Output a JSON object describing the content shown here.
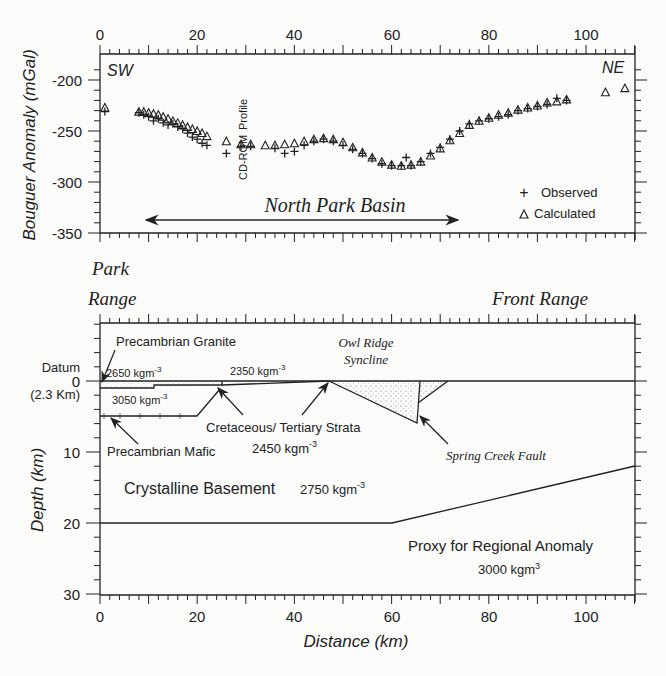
{
  "chart_data": [
    {
      "type": "scatter",
      "title": "",
      "xlabel": "Distance (km)",
      "ylabel": "Bouguer Anomaly (mGal)",
      "xlim": [
        0,
        110
      ],
      "ylim": [
        -350,
        -180
      ],
      "x_ticks": [
        0,
        20,
        40,
        60,
        80,
        100
      ],
      "y_ticks": [
        -200,
        -250,
        -300,
        -350
      ],
      "grid": false,
      "legend_position": "lower right",
      "legend": [
        "Observed",
        "Calculated"
      ],
      "annotations": [
        "SW",
        "NE",
        "CD-ROM Profile",
        "North Park Basin"
      ],
      "series": [
        {
          "name": "Observed",
          "marker": "+",
          "x": [
            1,
            8,
            9,
            10,
            11,
            12,
            13,
            14,
            15,
            16,
            17,
            18,
            19,
            20,
            21,
            22,
            26,
            29,
            31,
            36,
            38,
            40,
            42,
            44,
            46,
            48,
            50,
            52,
            54,
            56,
            58,
            60,
            62,
            63,
            64,
            66,
            68,
            70,
            72,
            74,
            76,
            78,
            80,
            82,
            84,
            86,
            88,
            90,
            92,
            94,
            96
          ],
          "y": [
            -231,
            -232,
            -234,
            -236,
            -240,
            -238,
            -242,
            -244,
            -243,
            -246,
            -248,
            -252,
            -256,
            -258,
            -262,
            -264,
            -272,
            -265,
            -265,
            -267,
            -272,
            -270,
            -264,
            -260,
            -258,
            -260,
            -264,
            -268,
            -272,
            -277,
            -282,
            -284,
            -284,
            -276,
            -284,
            -280,
            -272,
            -266,
            -258,
            -250,
            -243,
            -240,
            -238,
            -236,
            -234,
            -230,
            -228,
            -226,
            -224,
            -218,
            -220
          ]
        },
        {
          "name": "Calculated",
          "marker": "triangle",
          "x": [
            1,
            8,
            9,
            10,
            11,
            12,
            13,
            14,
            15,
            16,
            17,
            18,
            19,
            20,
            21,
            22,
            26,
            29,
            31,
            34,
            36,
            38,
            40,
            42,
            44,
            46,
            48,
            50,
            52,
            54,
            56,
            58,
            60,
            62,
            64,
            66,
            68,
            70,
            72,
            74,
            76,
            78,
            80,
            82,
            84,
            86,
            88,
            90,
            92,
            94,
            96,
            104,
            108
          ],
          "y": [
            -227,
            -231,
            -231,
            -232,
            -233,
            -234,
            -236,
            -238,
            -240,
            -242,
            -244,
            -246,
            -248,
            -250,
            -252,
            -255,
            -260,
            -263,
            -263,
            -264,
            -264,
            -263,
            -262,
            -260,
            -258,
            -257,
            -258,
            -261,
            -266,
            -271,
            -276,
            -280,
            -283,
            -284,
            -283,
            -280,
            -274,
            -267,
            -259,
            -252,
            -244,
            -240,
            -237,
            -234,
            -232,
            -229,
            -227,
            -225,
            -222,
            -221,
            -219,
            -212,
            -208
          ]
        }
      ]
    },
    {
      "type": "line",
      "title": "Cross-section density model",
      "xlabel": "Distance (km)",
      "ylabel": "Depth (km)",
      "xlim": [
        0,
        110
      ],
      "ylim": [
        30,
        -8
      ],
      "x_ticks": [
        0,
        20,
        40,
        60,
        80,
        100
      ],
      "y_ticks": [
        0,
        10,
        20,
        30
      ],
      "grid": false,
      "bodies": [
        {
          "name": "Precambrian Granite",
          "density": "2650 kgm-3",
          "polygon": [
            [
              0,
              0
            ],
            [
              10,
              0
            ],
            [
              10,
              1
            ],
            [
              0,
              1
            ]
          ]
        },
        {
          "name": "Upper strata",
          "density": "2350 kgm-3",
          "polygon": [
            [
              10,
              0
            ],
            [
              25,
              0
            ],
            [
              25,
              0.7
            ],
            [
              10,
              1
            ]
          ]
        },
        {
          "name": "Cretaceous/ Tertiary Strata",
          "density": "2450 kgm-3",
          "polygon": [
            [
              0,
              0
            ],
            [
              48,
              0
            ],
            [
              25,
              1.2
            ],
            [
              0,
              1.2
            ]
          ]
        },
        {
          "name": "Precambrian Mafic",
          "density": "3050 kgm-3",
          "polygon": [
            [
              0,
              1
            ],
            [
              25,
              1
            ],
            [
              21,
              5
            ],
            [
              0,
              5
            ]
          ]
        },
        {
          "name": "Owl Ridge Syncline",
          "density": "2450 kgm-3",
          "polygon": [
            [
              48,
              0
            ],
            [
              72,
              0
            ],
            [
              65,
              3.5
            ],
            [
              64,
              6
            ]
          ]
        },
        {
          "name": "Crystalline Basement",
          "density": "2750 kgm-3",
          "polygon": [
            [
              0,
              5
            ],
            [
              110,
              5
            ],
            [
              110,
              12
            ],
            [
              60,
              20
            ],
            [
              0,
              20
            ]
          ]
        },
        {
          "name": "Proxy for Regional Anomaly",
          "density": "3000 kgm3",
          "polygon": [
            [
              0,
              20
            ],
            [
              60,
              20
            ],
            [
              110,
              12
            ],
            [
              110,
              30
            ],
            [
              0,
              30
            ]
          ]
        }
      ],
      "annotations": [
        "Park Range",
        "Front Range",
        "Datum",
        "(2.3 Km)",
        "Spring Creek Fault",
        "Owl Ridge Syncline"
      ]
    }
  ],
  "top_plot": {
    "ylabel": "Bouguer Anomaly (mGal)",
    "x_tick_labels": [
      "0",
      "20",
      "40",
      "60",
      "80",
      "100"
    ],
    "y_tick_labels": [
      "-200",
      "-250",
      "-300",
      "-350"
    ],
    "sw_label": "SW",
    "ne_label": "NE",
    "cdrom_label": "CD-ROM",
    "profile_label": "Profile",
    "basin_label": "North Park Basin",
    "legend": {
      "observed": "Observed",
      "calculated": "Calculated",
      "plus": "+",
      "tri": "△"
    }
  },
  "bottom_plot": {
    "ylabel": "Depth (km)",
    "xlabel": "Distance (km)",
    "x_tick_labels": [
      "0",
      "20",
      "40",
      "60",
      "80",
      "100"
    ],
    "y_tick_labels": [
      "0",
      "10",
      "20",
      "30"
    ],
    "park": "Park",
    "range": "Range",
    "front_range": "Front  Range",
    "datum": "Datum",
    "datum_elev": "(2.3 Km)",
    "granite": "Precambrian Granite",
    "d2650": "2650 kgm",
    "d2350": "2350 kgm",
    "d3050": "3050 kgm",
    "exp": "-3",
    "owl1": "Owl Ridge",
    "owl2": "Syncline",
    "cret": "Cretaceous/ Tertiary Strata",
    "d2450": "2450 kgm",
    "mafic": "Precambrian Mafic",
    "spring": "Spring Creek Fault",
    "basement": "Crystalline Basement",
    "d2750": "2750 kgm",
    "proxy": "Proxy for Regional Anomaly",
    "d3000": "3000 kgm",
    "exp3": "3"
  }
}
